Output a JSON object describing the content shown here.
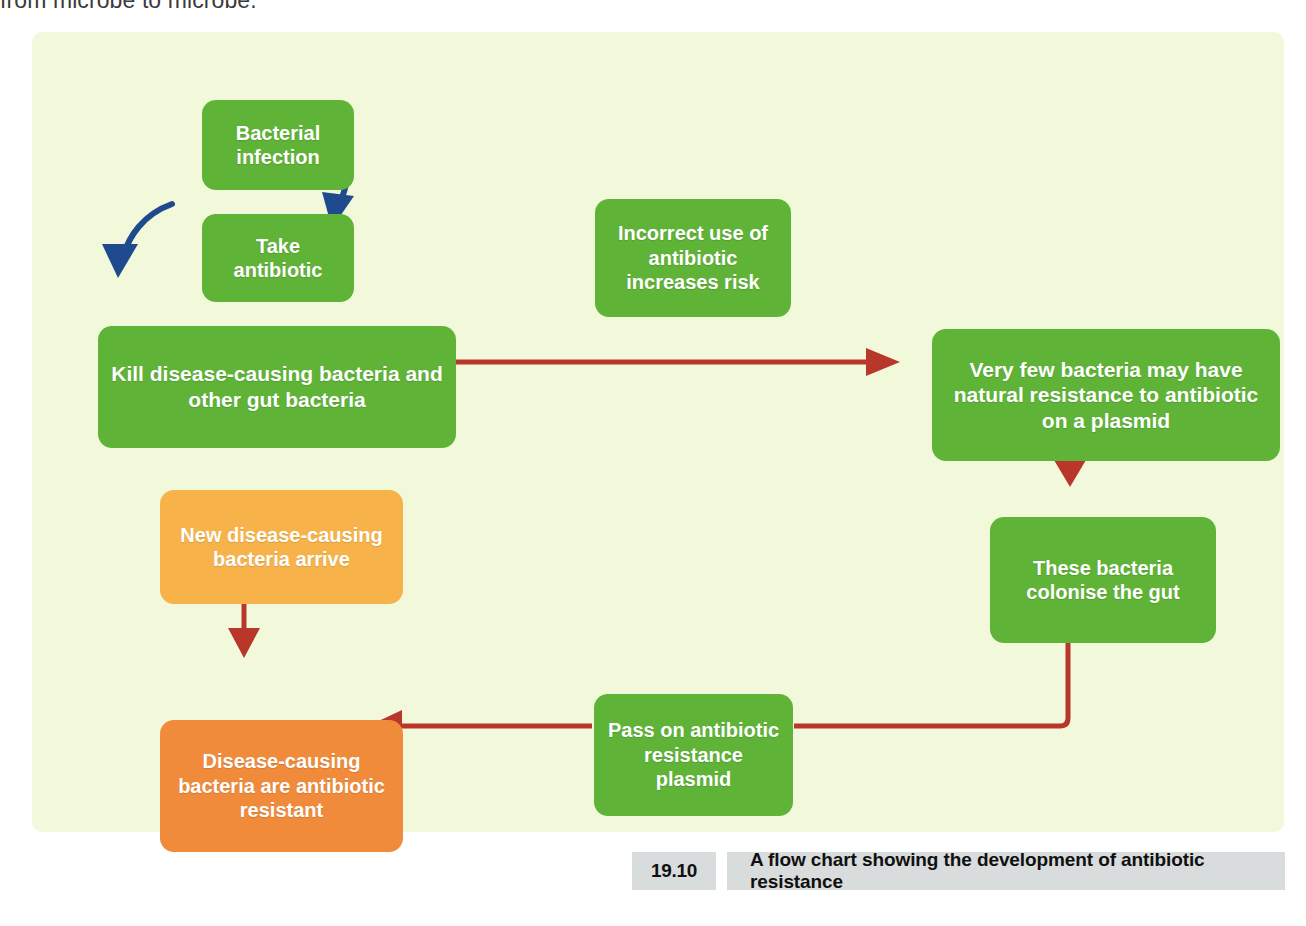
{
  "page": {
    "lead_text": "from microbe to microbe."
  },
  "figure": {
    "background_color": "#f2f9da",
    "colors": {
      "green": "#5fb337",
      "amber": "#f7b34a",
      "orange": "#f08b3c",
      "red_arrow": "#b8372a",
      "blue_arrow": "#1f4b8e",
      "caption_background": "#d9dcdd"
    },
    "nodes": [
      {
        "id": "bacterial-infection",
        "label": "Bacterial\ninfection",
        "color": "green"
      },
      {
        "id": "take-antibiotic",
        "label": "Take\nantibiotic",
        "color": "green"
      },
      {
        "id": "incorrect-use",
        "label": "Incorrect use of\nantibiotic\nincreases  risk",
        "color": "green"
      },
      {
        "id": "kill-bacteria",
        "label": "Kill disease-causing bacteria and\nother gut bacteria",
        "color": "green"
      },
      {
        "id": "very-few-bacteria",
        "label": "Very few bacteria may have\nnatural resistance to antibiotic\non a plasmid",
        "color": "green"
      },
      {
        "id": "new-disease-bacteria",
        "label": "New disease-causing\nbacteria arrive",
        "color": "amber"
      },
      {
        "id": "colonise-gut",
        "label": "These bacteria\ncolonise the gut",
        "color": "green"
      },
      {
        "id": "pass-plasmid",
        "label": "Pass on antibiotic\nresistance\nplasmid",
        "color": "green"
      },
      {
        "id": "resistant-bacteria",
        "label": "Disease-causing\nbacteria are antibiotic\nresistant",
        "color": "orange"
      }
    ],
    "edges": [
      {
        "from": "bacterial-infection",
        "to": "take-antibiotic",
        "style": "curved",
        "color": "#1f4b8e"
      },
      {
        "from": "take-antibiotic",
        "to": "kill-bacteria",
        "style": "curved",
        "color": "#1f4b8e"
      },
      {
        "from": "kill-bacteria",
        "to": "very-few-bacteria",
        "style": "straight-right",
        "color": "#b8372a"
      },
      {
        "from": "very-few-bacteria",
        "to": "colonise-gut",
        "style": "straight-down",
        "color": "#b8372a"
      },
      {
        "from": "colonise-gut",
        "to": "pass-plasmid",
        "style": "elbow-down-left",
        "color": "#b8372a"
      },
      {
        "from": "pass-plasmid",
        "to": "resistant-bacteria",
        "style": "straight-left",
        "color": "#b8372a"
      },
      {
        "from": "new-disease-bacteria",
        "to": "resistant-bacteria",
        "style": "straight-down",
        "color": "#b8372a"
      }
    ]
  },
  "caption": {
    "number": "19.10",
    "text": "A flow chart showing the development of antibiotic resistance"
  }
}
